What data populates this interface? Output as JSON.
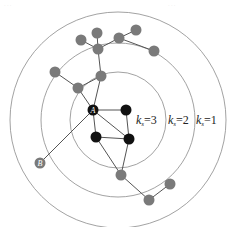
{
  "diagram": {
    "type": "k-shell decomposition",
    "center": [
      118,
      120
    ],
    "shells": [
      {
        "k": 3,
        "radius": 48,
        "label": "k",
        "sub": "s",
        "value": "=3",
        "label_pos": [
          136,
          124
        ]
      },
      {
        "k": 2,
        "radius": 77,
        "label": "k",
        "sub": "s",
        "value": "=2",
        "label_pos": [
          168,
          124
        ]
      },
      {
        "k": 1,
        "radius": 108,
        "label": "k",
        "sub": "s",
        "value": "=1",
        "label_pos": [
          196,
          124
        ]
      }
    ],
    "colors": {
      "core_node": "#111111",
      "periphery_node": "#7a7a7a",
      "edge": "#555555",
      "ring": "#8a8a8a"
    },
    "nodes": [
      {
        "id": "A",
        "label": "A",
        "x": 93,
        "y": 110,
        "core": true
      },
      {
        "id": "n2",
        "x": 126,
        "y": 110,
        "core": true
      },
      {
        "id": "n3",
        "x": 96,
        "y": 137,
        "core": true
      },
      {
        "id": "n4",
        "x": 129,
        "y": 139,
        "core": true
      },
      {
        "id": "n5",
        "x": 78,
        "y": 88
      },
      {
        "id": "n6",
        "x": 101,
        "y": 76
      },
      {
        "id": "n7",
        "x": 55,
        "y": 72
      },
      {
        "id": "n8",
        "x": 98,
        "y": 49
      },
      {
        "id": "n9",
        "x": 81,
        "y": 40
      },
      {
        "id": "n10",
        "x": 97,
        "y": 33
      },
      {
        "id": "n11",
        "x": 119,
        "y": 38
      },
      {
        "id": "n12",
        "x": 136,
        "y": 30
      },
      {
        "id": "n13",
        "x": 154,
        "y": 51
      },
      {
        "id": "B",
        "label": "B",
        "x": 40,
        "y": 163
      },
      {
        "id": "n15",
        "x": 121,
        "y": 175
      },
      {
        "id": "n16",
        "x": 149,
        "y": 200
      },
      {
        "id": "n17",
        "x": 170,
        "y": 184
      }
    ],
    "edges": [
      [
        "A",
        "n2"
      ],
      [
        "A",
        "n3"
      ],
      [
        "A",
        "n4"
      ],
      [
        "n2",
        "n4"
      ],
      [
        "n3",
        "n4"
      ],
      [
        "A",
        "n5"
      ],
      [
        "n5",
        "n7"
      ],
      [
        "n5",
        "n6"
      ],
      [
        "A",
        "n6"
      ],
      [
        "n6",
        "n8"
      ],
      [
        "n8",
        "n9"
      ],
      [
        "n8",
        "n10"
      ],
      [
        "n8",
        "n11"
      ],
      [
        "n11",
        "n12"
      ],
      [
        "n11",
        "n13"
      ],
      [
        "A",
        "B"
      ],
      [
        "n3",
        "n15"
      ],
      [
        "n4",
        "n15"
      ],
      [
        "n15",
        "n16"
      ],
      [
        "n16",
        "n17"
      ]
    ]
  },
  "watermark": {
    "left": "· · ·",
    "right": "· · ·"
  }
}
